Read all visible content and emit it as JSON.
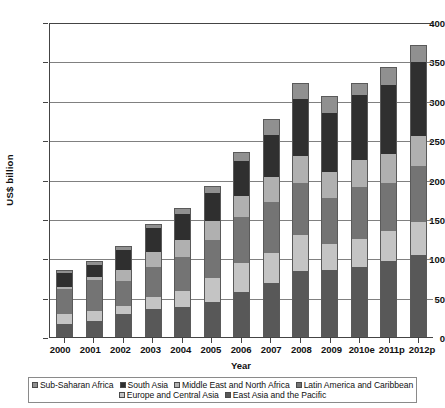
{
  "chart_data": {
    "type": "bar",
    "subtype": "stacked-bar",
    "title": "",
    "xlabel": "Year",
    "ylabel": "US$ billion",
    "ylim": [
      0,
      400
    ],
    "yticks": [
      0,
      50,
      100,
      150,
      200,
      250,
      300,
      350,
      400
    ],
    "grid": true,
    "legend_position": "bottom",
    "categories": [
      "2000",
      "2001",
      "2002",
      "2003",
      "2004",
      "2005",
      "2006",
      "2007",
      "2008",
      "2009",
      "2010e",
      "2011p",
      "2012p"
    ],
    "stack_order_bottom_to_top": [
      "East Asia and the Pacific",
      "Europe and Central Asia",
      "Latin America and Caribbean",
      "Middle East and North Africa",
      "South Asia",
      "Sub-Saharan Africa"
    ],
    "series": [
      {
        "name": "East Asia and the Pacific",
        "color": "#585858",
        "values": [
          17,
          20,
          29,
          35,
          38,
          44,
          57,
          69,
          84,
          85,
          89,
          96,
          104
        ]
      },
      {
        "name": "Europe and Central Asia",
        "color": "#c4c4c4",
        "values": [
          12,
          13,
          10,
          16,
          21,
          31,
          37,
          38,
          46,
          33,
          36,
          38,
          42
        ]
      },
      {
        "name": "Latin America and Caribbean",
        "color": "#747474",
        "values": [
          32,
          39,
          32,
          38,
          42,
          48,
          59,
          65,
          65,
          59,
          66,
          62,
          71
        ]
      },
      {
        "name": "Middle East and North Africa",
        "color": "#b0b0b0",
        "values": [
          3,
          4,
          14,
          19,
          22,
          24,
          26,
          31,
          35,
          33,
          34,
          36,
          38
        ]
      },
      {
        "name": "South Asia",
        "color": "#2f2f2f",
        "values": [
          17,
          15,
          25,
          31,
          33,
          36,
          44,
          54,
          72,
          75,
          82,
          88,
          94
        ]
      },
      {
        "name": "Sub-Saharan Africa",
        "color": "#909090",
        "values": [
          4,
          5,
          5,
          5,
          8,
          9,
          12,
          20,
          21,
          21,
          16,
          23,
          22
        ]
      }
    ],
    "totals": [
      85,
      96,
      115,
      144,
      164,
      192,
      235,
      277,
      323,
      306,
      323,
      343,
      371
    ]
  },
  "axes": {
    "y_title": "US$ billion",
    "x_title": "Year",
    "y_tick_labels": [
      "400",
      "350",
      "300",
      "250",
      "200",
      "150",
      "100",
      "50",
      "0"
    ],
    "x_tick_labels": [
      "2000",
      "2001",
      "2002",
      "2003",
      "2004",
      "2005",
      "2006",
      "2007",
      "2008",
      "2009",
      "2010e",
      "2011p",
      "2012p"
    ]
  },
  "legend": {
    "row1": [
      {
        "label": "Sub-Saharan Africa",
        "color": "#909090"
      },
      {
        "label": "South Asia",
        "color": "#2f2f2f"
      },
      {
        "label": "Middle East and North Africa",
        "color": "#b0b0b0"
      },
      {
        "label": "Latin America and Caribbean",
        "color": "#747474"
      }
    ],
    "row2": [
      {
        "label": "Europe and Central Asia",
        "color": "#c4c4c4"
      },
      {
        "label": "East Asia and the Pacific",
        "color": "#585858"
      }
    ]
  }
}
